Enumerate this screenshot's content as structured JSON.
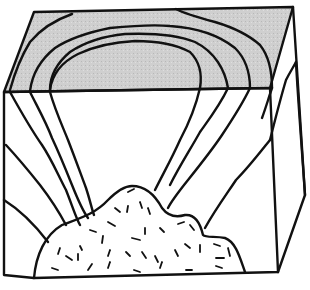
{
  "diagram": {
    "type": "block-diagram",
    "colors": {
      "ink": "#111111",
      "top_shading": "#c9c9c9",
      "background": "#ffffff"
    },
    "parts": [
      {
        "id": "top-surface",
        "description": "shaded top face showing concentric arcs of layers"
      },
      {
        "id": "front-face",
        "description": "front cross-section with layers dipping away from a central body"
      },
      {
        "id": "side-face",
        "description": "right side face"
      },
      {
        "id": "intrusion",
        "description": "speckled igneous body at bottom center"
      }
    ],
    "labels": []
  }
}
